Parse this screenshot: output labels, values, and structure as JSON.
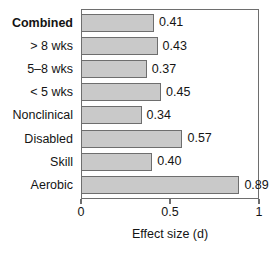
{
  "chart_data": {
    "type": "bar",
    "orientation": "horizontal",
    "title": "",
    "subtitle": "",
    "xlabel": "Effect size (d)",
    "ylabel": "",
    "xlim": [
      0,
      1
    ],
    "xticks": [
      0,
      0.5,
      1
    ],
    "xtick_labels": [
      "0",
      "0.5",
      "1"
    ],
    "grid": false,
    "legend": null,
    "categories": [
      "Combined",
      "> 8 wks",
      "5–8 wks",
      "< 5 wks",
      "Nonclinical",
      "Disabled",
      "Skill",
      "Aerobic"
    ],
    "values": [
      0.41,
      0.43,
      0.37,
      0.45,
      0.34,
      0.57,
      0.4,
      0.89
    ],
    "value_labels": [
      "0.41",
      "0.43",
      "0.37",
      "0.45",
      "0.34",
      "0.57",
      "0.40",
      "0.89"
    ],
    "emphasized_categories": [
      "Combined"
    ],
    "colors": {
      "bar_fill": "#c9c9c9",
      "bar_stroke": "#6e6e6e",
      "axis": "#6e6e6e",
      "text": "#141414",
      "background": "#ffffff"
    }
  }
}
